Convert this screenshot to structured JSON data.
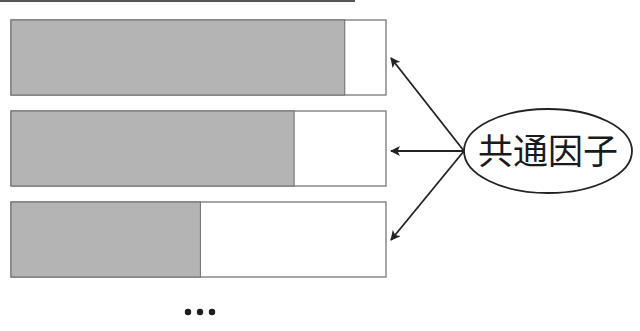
{
  "diagram": {
    "factor_label": "共通因子",
    "ellipsis": "...",
    "bars": [
      {
        "name": "variable-1",
        "common_share": 0.89
      },
      {
        "name": "variable-2",
        "common_share": 0.755
      },
      {
        "name": "variable-3",
        "common_share": 0.505
      }
    ],
    "colors": {
      "common_fill": "#b4b4b4",
      "unique_fill": "#ffffff",
      "arrow": "#222222"
    }
  }
}
